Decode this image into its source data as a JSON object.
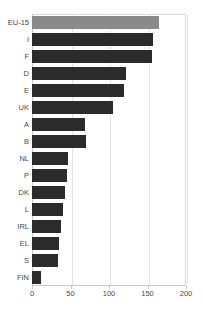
{
  "chart_data": {
    "type": "bar",
    "orientation": "horizontal",
    "title": "",
    "xlabel": "",
    "ylabel": "",
    "xlim": [
      0,
      200
    ],
    "xticks": [
      0,
      50,
      100,
      150,
      200
    ],
    "grid": true,
    "grid_axis": "x",
    "legend": false,
    "categories": [
      "EU-15",
      "I",
      "F",
      "D",
      "E",
      "UK",
      "A",
      "B",
      "NL",
      "P",
      "DK",
      "L",
      "IRL",
      "EL",
      "S",
      "FIN"
    ],
    "values": [
      165,
      157,
      156,
      122,
      119,
      105,
      69,
      70,
      47,
      45,
      43,
      40,
      38,
      35,
      34,
      12
    ],
    "series": [
      {
        "name": "value",
        "values": [
          165,
          157,
          156,
          122,
          119,
          105,
          69,
          70,
          47,
          45,
          43,
          40,
          38,
          35,
          34,
          12
        ]
      }
    ],
    "highlight_category": "EU-15",
    "colors": {
      "bar": "#2b2b2b",
      "highlight_bar": "#8a8a8a",
      "grid": "#e2e2e2",
      "axis": "#c9c9c9",
      "text": "#4a4a4a"
    }
  },
  "axis": {
    "x_tick_labels": [
      "0",
      "50",
      "100",
      "150",
      "200"
    ]
  }
}
